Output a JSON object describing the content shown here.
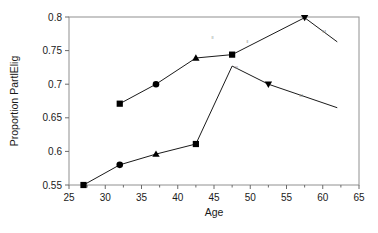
{
  "chart_data": {
    "type": "line",
    "title": "",
    "xlabel": "Age",
    "ylabel": "Proportion PartlElig",
    "xlim": [
      25,
      65
    ],
    "ylim": [
      0.55,
      0.8
    ],
    "xticks": [
      25,
      30,
      35,
      40,
      45,
      50,
      55,
      60,
      65
    ],
    "xtick_labels": [
      "25",
      "30",
      "35",
      "40",
      "45",
      "50",
      "55",
      "60",
      "65"
    ],
    "xminor_step": 2.5,
    "yticks": [
      0.55,
      0.6,
      0.65,
      0.7,
      0.75,
      0.8
    ],
    "ytick_labels": [
      "0.55",
      "0.6",
      "0.65",
      "0.7",
      "0.75",
      "0.8"
    ],
    "grid": false,
    "legend": "none",
    "border": "box",
    "series": [
      {
        "name": "upper",
        "color": "#000000",
        "points": [
          {
            "x": 32.0,
            "y": 0.671,
            "marker": "square"
          },
          {
            "x": 37.0,
            "y": 0.7,
            "marker": "circle"
          },
          {
            "x": 42.5,
            "y": 0.739,
            "marker": "triangle"
          },
          {
            "x": 47.5,
            "y": 0.744,
            "marker": "square"
          },
          {
            "x": 57.5,
            "y": 0.799,
            "marker": "triangle-down"
          },
          {
            "x": 62.0,
            "y": 0.763,
            "marker": "none"
          }
        ]
      },
      {
        "name": "lower",
        "color": "#000000",
        "points": [
          {
            "x": 27.0,
            "y": 0.55,
            "marker": "square"
          },
          {
            "x": 32.0,
            "y": 0.58,
            "marker": "circle"
          },
          {
            "x": 37.0,
            "y": 0.596,
            "marker": "triangle"
          },
          {
            "x": 42.5,
            "y": 0.611,
            "marker": "square"
          },
          {
            "x": 47.5,
            "y": 0.727,
            "marker": "none"
          },
          {
            "x": 52.5,
            "y": 0.7,
            "marker": "triangle-down"
          },
          {
            "x": 62.0,
            "y": 0.665,
            "marker": "none"
          }
        ]
      }
    ],
    "annotations": [
      {
        "x": 44.8,
        "y": 0.768,
        "text": "ll"
      },
      {
        "x": 49.6,
        "y": 0.761,
        "text": "ll"
      },
      {
        "x": 48.1,
        "y": 0.722,
        "text": "lll"
      },
      {
        "x": 60.2,
        "y": 0.776,
        "text": "M"
      },
      {
        "x": 57.0,
        "y": 0.681,
        "text": "M"
      }
    ]
  }
}
